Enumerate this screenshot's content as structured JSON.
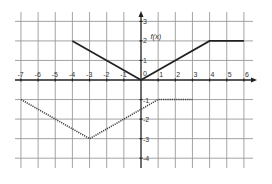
{
  "chart_data": {
    "type": "line",
    "title": "",
    "xlabel": "",
    "ylabel": "",
    "xlim": [
      -7,
      6
    ],
    "ylim": [
      -4,
      3
    ],
    "grid": true,
    "x_ticks": [
      -7,
      -6,
      -5,
      -4,
      -3,
      -2,
      -1,
      1,
      2,
      3,
      4,
      5,
      6
    ],
    "y_ticks": [
      3,
      2,
      1,
      -1,
      -2,
      -3,
      -4
    ],
    "origin_label": "0",
    "annotations": [
      {
        "text": "f(x)",
        "x": 0.55,
        "y": 2.0
      }
    ],
    "series": [
      {
        "name": "f(x)",
        "style": "solid",
        "color": "#222222",
        "points": [
          [
            -4,
            2
          ],
          [
            0,
            0
          ],
          [
            4,
            2
          ],
          [
            6,
            2
          ]
        ]
      },
      {
        "name": "transformed",
        "style": "dotted",
        "color": "#444444",
        "points": [
          [
            -7,
            -1
          ],
          [
            -3,
            -3
          ],
          [
            1,
            -1
          ],
          [
            3,
            -1
          ]
        ]
      }
    ]
  },
  "layout": {
    "origin_px": [
      141,
      80
    ],
    "unit_x_px": 17.15,
    "unit_y_px": 19.55,
    "grid_color": "#9a9a9a",
    "axis_color": "#222222"
  }
}
